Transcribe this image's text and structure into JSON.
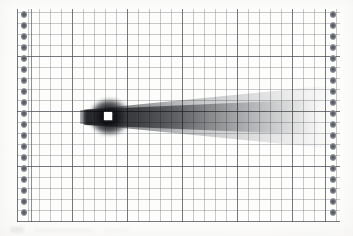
{
  "figure": {
    "kind": "scanned-grid-image",
    "title": "",
    "caption": "",
    "description": "Grayscale scanned plate showing a bright saturated square source with a dark plume extending horizontally to the right across a ruled grid",
    "background_color": "#fdfdfc",
    "paper_color": "#ffffff"
  },
  "plate": {
    "x": 17,
    "y": 9,
    "width": 323,
    "height": 213,
    "grid": {
      "cell_px": 11,
      "heavy_every": 5,
      "columns": 27,
      "rows": 19,
      "fine_line_color": "#60646c",
      "heavy_line_color": "#46484e",
      "grid_on": true
    }
  },
  "perforation": {
    "dot_count": 19,
    "dot_color": "#6d7178",
    "strip_width_px": 14,
    "left_label": "left-index-strip",
    "right_label": "right-index-strip"
  },
  "source": {
    "label": "saturated-source",
    "color": "#ffffff",
    "x": 108,
    "y": 116,
    "size_px": 8
  },
  "plume": {
    "label": "plume",
    "direction": "right",
    "core_color": "#141518",
    "halo_color": "#6e7278",
    "start_x": 84,
    "end_x": 320,
    "axis_y": 117,
    "head_width_px": 18,
    "tail_width_px": 52
  },
  "chart_data": {
    "type": "heatmap",
    "title": "",
    "subtitle": "",
    "xlabel": "",
    "ylabel": "",
    "legend": [],
    "annotations": [
      "saturated white square source at grid column 8, row 10",
      "dark plume extends rightward, broadening and fading"
    ],
    "grid": true,
    "grid_spacing": 1,
    "xlim": [
      0,
      27
    ],
    "ylim": [
      0,
      19
    ],
    "xtick_labels": [],
    "ytick_labels": [],
    "x": [
      8,
      9,
      10,
      11,
      12,
      13,
      14,
      15,
      16,
      17,
      18,
      19,
      20,
      21,
      22,
      23,
      24,
      25,
      26,
      27
    ],
    "series": [
      {
        "name": "plume-axis-intensity",
        "values": [
          100,
          92,
          82,
          74,
          68,
          62,
          57,
          52,
          47,
          43,
          38,
          34,
          30,
          26,
          22,
          18,
          14,
          10,
          6,
          2
        ]
      },
      {
        "name": "plume-half-width-cells",
        "values": [
          0.8,
          0.9,
          1.0,
          1.1,
          1.2,
          1.3,
          1.4,
          1.5,
          1.6,
          1.7,
          1.8,
          1.9,
          2.0,
          2.1,
          2.2,
          2.3,
          2.3,
          2.4,
          2.4,
          2.5
        ]
      }
    ]
  },
  "smudges": {
    "note": "faint scanner artifacts below the plate",
    "items": [
      "smudge-a",
      "smudge-b",
      "smudge-c"
    ]
  }
}
